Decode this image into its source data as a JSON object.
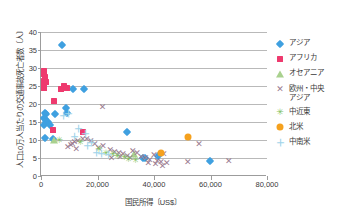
{
  "chart_data": {
    "type": "scatter",
    "title": "",
    "xlabel": "国民所得〔US$〕",
    "ylabel": "人口10万人当たりの交通事故死亡者数〔人〕",
    "xlim": [
      0,
      80000
    ],
    "ylim": [
      0,
      40
    ],
    "xticks": [
      "0",
      "20,000",
      "40,000",
      "60,000",
      "80,000"
    ],
    "xtick_values": [
      0,
      20000,
      40000,
      60000,
      80000
    ],
    "yticks": [
      "0",
      "5",
      "10",
      "15",
      "20",
      "25",
      "30",
      "35",
      "40"
    ],
    "ytick_values": [
      0,
      5,
      10,
      15,
      20,
      25,
      30,
      35,
      40
    ],
    "grid": "horizontal",
    "legend_position": "right",
    "series": [
      {
        "name": "アジア",
        "marker": "diamond",
        "color": "#3fa0e0",
        "points": [
          [
            7600,
            36.3
          ],
          [
            11500,
            24.2
          ],
          [
            15300,
            24.2
          ],
          [
            8700,
            19.0
          ],
          [
            1500,
            17.4
          ],
          [
            1900,
            17.2
          ],
          [
            5000,
            17.2
          ],
          [
            1200,
            16.2
          ],
          [
            1400,
            15.8
          ],
          [
            1700,
            15.0
          ],
          [
            2400,
            14.9
          ],
          [
            900,
            14.3
          ],
          [
            3300,
            14.2
          ],
          [
            9200,
            17.5
          ],
          [
            1400,
            10.6
          ],
          [
            4200,
            10.2
          ],
          [
            30600,
            12.3
          ],
          [
            36200,
            5.1
          ],
          [
            36800,
            4.9
          ],
          [
            41500,
            5.6
          ],
          [
            59700,
            4.1
          ]
        ]
      },
      {
        "name": "アフリカ",
        "marker": "square",
        "color": "#ee3a6e",
        "points": [
          [
            900,
            29.3
          ],
          [
            1100,
            28.2
          ],
          [
            1300,
            27.6
          ],
          [
            1000,
            26.3
          ],
          [
            1600,
            26.0
          ],
          [
            900,
            25.2
          ],
          [
            1200,
            24.4
          ],
          [
            8000,
            25.1
          ],
          [
            7100,
            24.3
          ],
          [
            9300,
            24.5
          ],
          [
            4600,
            20.8
          ],
          [
            4300,
            12.9
          ],
          [
            14800,
            12.3
          ]
        ]
      },
      {
        "name": "オセアニア",
        "marker": "triangle",
        "color": "#a9d18e",
        "points": [
          [
            4500,
            10.1
          ],
          [
            33000,
            6.0
          ]
        ]
      },
      {
        "name": "欧州・中央アジア",
        "marker": "x",
        "color": "#9b7b8f",
        "points": [
          [
            21800,
            19.2
          ],
          [
            55900,
            9.0
          ],
          [
            14800,
            10.3
          ],
          [
            13000,
            9.8
          ],
          [
            11900,
            9.5
          ],
          [
            11200,
            8.9
          ],
          [
            10500,
            8.5
          ],
          [
            16200,
            10.2
          ],
          [
            17600,
            9.7
          ],
          [
            19000,
            8.8
          ],
          [
            20400,
            7.9
          ],
          [
            22000,
            8.2
          ],
          [
            24500,
            7.2
          ],
          [
            26000,
            6.8
          ],
          [
            27500,
            6.3
          ],
          [
            29000,
            6.0
          ],
          [
            30500,
            5.5
          ],
          [
            31500,
            5.0
          ],
          [
            32500,
            7.0
          ],
          [
            34000,
            6.5
          ],
          [
            35500,
            5.4
          ],
          [
            37000,
            4.9
          ],
          [
            38500,
            4.4
          ],
          [
            40000,
            5.8
          ],
          [
            41200,
            4.3
          ],
          [
            42500,
            3.8
          ],
          [
            43500,
            6.0
          ],
          [
            44500,
            3.6
          ],
          [
            43000,
            2.9
          ],
          [
            40500,
            3.2
          ],
          [
            38000,
            3.6
          ],
          [
            52000,
            3.9
          ],
          [
            66500,
            4.2
          ],
          [
            9500,
            8.0
          ],
          [
            12500,
            7.4
          ],
          [
            28000,
            5.2
          ],
          [
            25000,
            4.9
          ]
        ]
      },
      {
        "name": "中近東",
        "marker": "star",
        "color": "#7fbf5f",
        "points": [
          [
            6500,
            10.0
          ],
          [
            14000,
            9.5
          ],
          [
            20500,
            7.5
          ],
          [
            23000,
            6.3
          ],
          [
            25500,
            6.2
          ],
          [
            27000,
            5.5
          ],
          [
            29500,
            5.3
          ],
          [
            31000,
            4.7
          ],
          [
            33500,
            4.4
          ]
        ]
      },
      {
        "name": "北米",
        "marker": "circle",
        "color": "#f5a11e",
        "points": [
          [
            52200,
            10.9
          ],
          [
            42500,
            6.4
          ]
        ]
      },
      {
        "name": "中南米",
        "marker": "plus",
        "color": "#9fd4ea",
        "points": [
          [
            9800,
            17.3
          ],
          [
            7900,
            16.7
          ],
          [
            13200,
            13.0
          ],
          [
            15800,
            11.8
          ],
          [
            12000,
            10.7
          ],
          [
            18000,
            9.3
          ],
          [
            16500,
            8.2
          ],
          [
            19500,
            6.5
          ],
          [
            21500,
            6.1
          ],
          [
            24000,
            5.8
          ]
        ]
      }
    ]
  },
  "legend": {
    "items": [
      {
        "label": "アジア",
        "marker": "diamond-marker-icon"
      },
      {
        "label": "アフリカ",
        "marker": "square-marker-icon"
      },
      {
        "label": "オセアニア",
        "marker": "triangle-marker-icon"
      },
      {
        "label": "欧州・中央\nアジア",
        "marker": "x-marker-icon"
      },
      {
        "label": "中近東",
        "marker": "star-marker-icon"
      },
      {
        "label": "北米",
        "marker": "circle-marker-icon"
      },
      {
        "label": "中南米",
        "marker": "plus-marker-icon"
      }
    ]
  }
}
